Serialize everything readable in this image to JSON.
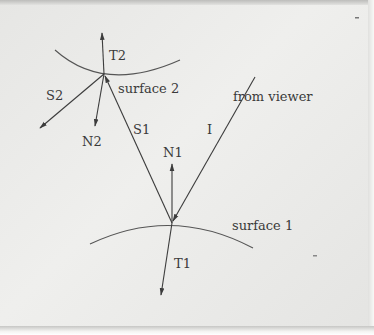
{
  "diagram": {
    "type": "ray-tracing-refraction",
    "labels": {
      "t2": "T2",
      "surface2": "surface 2",
      "from_viewer": "from viewer",
      "s2": "S2",
      "n2": "N2",
      "s1": "S1",
      "i": "I",
      "n1": "N1",
      "surface1": "surface 1",
      "t1": "T1"
    },
    "colors": {
      "line": "#3c3c3c",
      "background": "#ebebe9"
    }
  }
}
